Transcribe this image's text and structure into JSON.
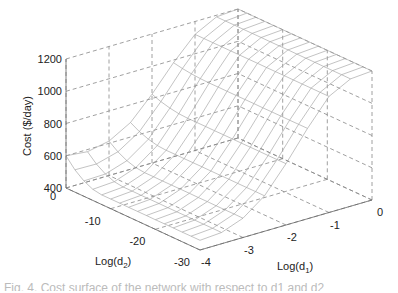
{
  "chart_data": {
    "type": "surface",
    "title": "",
    "xlabel": "Log(d1)",
    "xlabel_base": "Log(d",
    "xlabel_sub": "1",
    "ylabel": "Log(d2)",
    "ylabel_base": "Log(d",
    "ylabel_sub": "2",
    "zlabel": "Cost ($/day)",
    "xlim": [
      -4,
      0
    ],
    "ylim": [
      -30,
      0
    ],
    "zlim": [
      400,
      1200
    ],
    "xticks": [
      -4,
      -3,
      -2,
      -1,
      0
    ],
    "yticks": [
      0,
      -10,
      -20,
      -30
    ],
    "zticks": [
      400,
      600,
      800,
      1000,
      1200
    ],
    "grid": true,
    "style": "wireframe mesh, light gray",
    "x": [
      -4,
      -3.5,
      -3,
      -2.5,
      -2,
      -1.5,
      -1,
      -0.5,
      0
    ],
    "y": [
      0,
      -2,
      -4,
      -6,
      -8,
      -10,
      -12,
      -14,
      -16,
      -18,
      -20,
      -22,
      -24,
      -26,
      -28,
      -30
    ],
    "z_description": "Cost rises steeply with Log(d1) toward 0 (plateau ~1200 at Log(d1) >= -1); minimum ~450 near Log(d1)=-4; slight rise near Log(d2)=0",
    "z_profile_vs_log_d1": {
      "log_d1": [
        -4,
        -3.5,
        -3,
        -2.5,
        -2,
        -1.5,
        -1,
        -0.5,
        0
      ],
      "cost": [
        460,
        470,
        520,
        620,
        780,
        960,
        1120,
        1190,
        1200
      ]
    }
  },
  "caption": "Fig. 4. Cost surface of the network with respect to d1 and d2"
}
